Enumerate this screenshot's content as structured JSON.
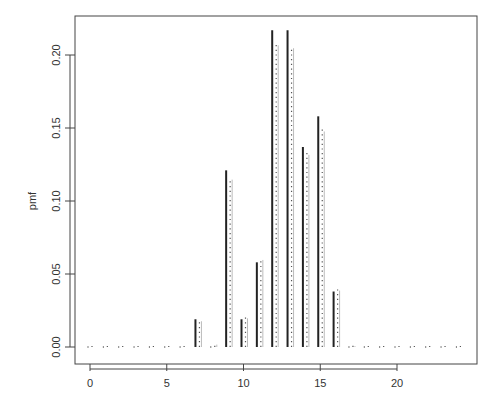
{
  "chart_data": {
    "type": "bar",
    "title": "",
    "xlabel": "",
    "ylabel": "pmf",
    "xlim": [
      -1,
      24.5
    ],
    "ylim": [
      -0.008,
      0.23
    ],
    "xticks": [
      0,
      5,
      10,
      15,
      20
    ],
    "yticks": [
      "0.00",
      "0.05",
      "0.10",
      "0.15",
      "0.20"
    ],
    "grid": false,
    "legend": null,
    "x": [
      0,
      1,
      2,
      3,
      4,
      5,
      6,
      7,
      8,
      9,
      10,
      11,
      12,
      13,
      14,
      15,
      16,
      17,
      18,
      19,
      20,
      21,
      22,
      23,
      24
    ],
    "series": [
      {
        "name": "solid",
        "style": "solid",
        "values": [
          0,
          0,
          0,
          0,
          0,
          0,
          0,
          0.019,
          0,
          0.121,
          0.019,
          0.058,
          0.217,
          0.217,
          0.137,
          0.158,
          0.038,
          0,
          0,
          0,
          0,
          0,
          0,
          0,
          0
        ]
      },
      {
        "name": "dotted",
        "style": "dotted",
        "values": [
          0,
          0,
          0,
          0,
          0,
          0,
          0,
          0.019,
          0.003,
          0.116,
          0.021,
          0.061,
          0.208,
          0.206,
          0.133,
          0.149,
          0.04,
          0.002,
          0,
          0,
          0,
          0,
          0,
          0,
          0
        ]
      }
    ]
  }
}
